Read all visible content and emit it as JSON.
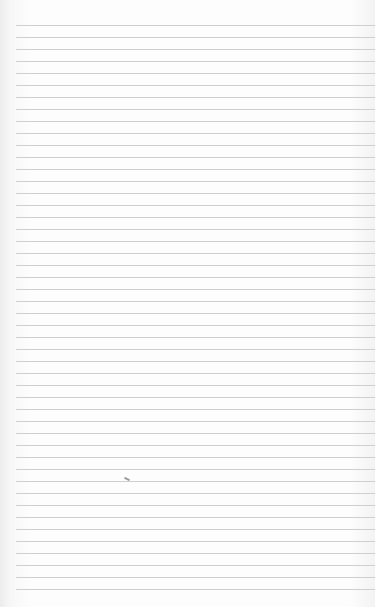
{
  "paper": {
    "line_count": 48,
    "first_line_y": 25,
    "line_spacing": 12,
    "line_left": 16,
    "line_color": "#cfcfcf",
    "background": "#fdfdfd"
  },
  "mark": {
    "x": 124,
    "y": 478
  }
}
